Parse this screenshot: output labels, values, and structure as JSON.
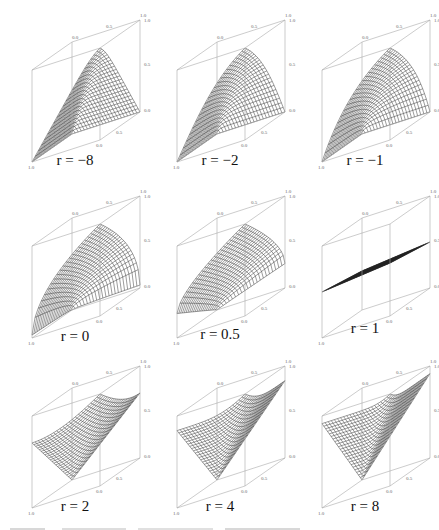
{
  "figure": {
    "axis_ticks": [
      "0.0",
      "0.5",
      "1.0"
    ],
    "panels": [
      {
        "label": "r = −8",
        "r": -8,
        "shape": "spike-up",
        "height": 0.0
      },
      {
        "label": "r = −2",
        "r": -2,
        "shape": "spike-up",
        "height": 0.15
      },
      {
        "label": "r = −1",
        "r": -1,
        "shape": "bowl-up",
        "height": 0.3
      },
      {
        "label": "r = 0",
        "r": 0,
        "shape": "bowl-up",
        "height": 0.45
      },
      {
        "label": "r = 0.5",
        "r": 0.5,
        "shape": "bowl-flat",
        "height": 0.6
      },
      {
        "label": "r = 1",
        "r": 1,
        "shape": "flat",
        "height": 0.5
      },
      {
        "label": "r = 2",
        "r": 2,
        "shape": "peak",
        "height": 0.45
      },
      {
        "label": "r = 4",
        "r": 4,
        "shape": "peak",
        "height": 0.6
      },
      {
        "label": "r = 8",
        "r": 8,
        "shape": "peak-sharp",
        "height": 0.8
      }
    ]
  },
  "chart_data": {
    "type": "surface-grid",
    "title": "",
    "layout": {
      "rows": 3,
      "cols": 3
    },
    "axes": {
      "x_ticks": [
        0.0,
        0.5,
        1.0
      ],
      "y_ticks": [
        0.0,
        0.5,
        1.0
      ],
      "z_ticks": [
        0.0,
        0.5,
        1.0
      ],
      "xlim": [
        0,
        1
      ],
      "ylim": [
        0,
        1
      ],
      "zlim": [
        0,
        1
      ]
    },
    "panels": [
      {
        "r": -8,
        "label": "r = −8"
      },
      {
        "r": -2,
        "label": "r = −2"
      },
      {
        "r": -1,
        "label": "r = −1"
      },
      {
        "r": 0,
        "label": "r = 0"
      },
      {
        "r": 0.5,
        "label": "r = 0.5"
      },
      {
        "r": 1,
        "label": "r = 1"
      },
      {
        "r": 2,
        "label": "r = 2"
      },
      {
        "r": 4,
        "label": "r = 4"
      },
      {
        "r": 8,
        "label": "r = 8"
      }
    ]
  }
}
